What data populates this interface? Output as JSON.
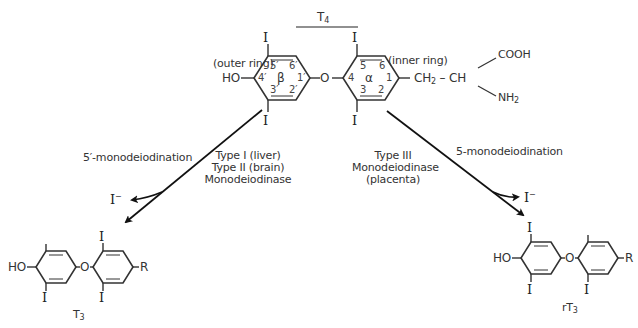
{
  "diagram": {
    "title": {
      "main": "T",
      "sub": "4"
    },
    "t4": {
      "outer_ring_label": "(outer ring)",
      "inner_ring_label": "(inner ring)",
      "hydroxyl": "HO",
      "bridge_oxygen": "O",
      "iodine": "I",
      "outer_ring_greek": "β",
      "inner_ring_greek": "α",
      "outer_ring_positions": [
        "5′",
        "6′",
        "4′",
        "1′",
        "3′",
        "2′"
      ],
      "inner_ring_positions": [
        "5",
        "6",
        "4",
        "1",
        "3",
        "2"
      ],
      "side_chain": {
        "ch2": "CH",
        "ch2_sub": "2",
        "dash": "–",
        "ch": "CH",
        "carboxyl": "COOH",
        "amine": "NH",
        "amine_sub": "2"
      }
    },
    "left_pathway": {
      "reaction": "5′-monodeiodination",
      "enzyme_lines": [
        "Type I (liver)",
        "Type II (brain)",
        "Monodeiodinase"
      ],
      "released": "I",
      "released_charge": "−"
    },
    "right_pathway": {
      "reaction": "5-monodeiodination",
      "enzyme_lines": [
        "Type III",
        "Monodeiodinase",
        "(placenta)"
      ],
      "released": "I",
      "released_charge": "−"
    },
    "t3": {
      "name": "T",
      "name_sub": "3",
      "hydroxyl": "HO",
      "bridge_oxygen": "O",
      "iodine": "I",
      "r_group": "R"
    },
    "rt3": {
      "name": "rT",
      "name_sub": "3",
      "hydroxyl": "HO",
      "bridge_oxygen": "O",
      "iodine": "I",
      "r_group": "R"
    },
    "colors": {
      "ink": "#222222",
      "ring_line": "#333333",
      "background": "#ffffff"
    }
  }
}
